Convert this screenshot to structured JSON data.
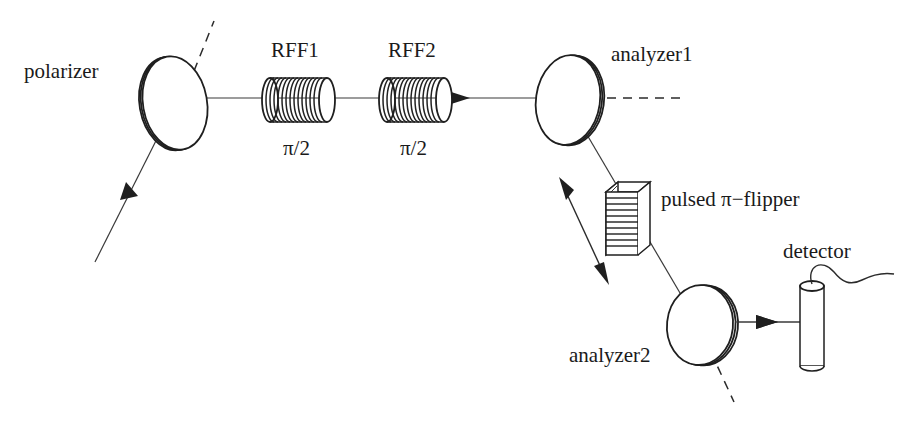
{
  "figure": {
    "background_color": "#ffffff",
    "line_color": "#2b2b2b",
    "width": 904,
    "height": 432
  },
  "labels": {
    "polarizer": "polarizer",
    "rff1": "RFF1",
    "rff1_angle": "π/2",
    "rff2": "RFF2",
    "rff2_angle": "π/2",
    "analyzer1": "analyzer1",
    "pulsed_flipper": "pulsed π−flipper",
    "analyzer2": "analyzer2",
    "detector": "detector"
  },
  "components": [
    {
      "name": "polarizer",
      "label": "polarizer",
      "kind": "tilted-disk",
      "center": [
        175,
        103
      ],
      "rx": 32,
      "ry": 47,
      "edge_side": "left"
    },
    {
      "name": "rff1",
      "label": "RFF1",
      "sublabel": "π/2",
      "kind": "solenoid-coil",
      "center": [
        298,
        100
      ],
      "length": 60,
      "radius": 23,
      "turns": 13
    },
    {
      "name": "rff2",
      "label": "RFF2",
      "sublabel": "π/2",
      "kind": "solenoid-coil",
      "center": [
        415,
        100
      ],
      "length": 60,
      "radius": 23,
      "turns": 13
    },
    {
      "name": "analyzer1",
      "label": "analyzer1",
      "kind": "tilted-disk",
      "center": [
        568,
        100
      ],
      "rx": 33,
      "ry": 45,
      "edge_side": "right"
    },
    {
      "name": "pulsed-flipper",
      "label": "pulsed π−flipper",
      "kind": "striped-box",
      "origin": [
        606,
        186
      ],
      "width": 32,
      "height": 68,
      "depth": 12,
      "stripes": 11
    },
    {
      "name": "analyzer2",
      "label": "analyzer2",
      "kind": "tilted-disk",
      "center": [
        700,
        325
      ],
      "rx": 34,
      "ry": 40,
      "edge_side": "right"
    },
    {
      "name": "detector",
      "label": "detector",
      "kind": "cylinder-with-cable",
      "center": [
        812,
        325
      ],
      "width": 24,
      "height": 86
    }
  ],
  "beam_path": {
    "description": "neutron beam from lower-left through polarizer, RFF1, RFF2, analyzer1, flipper, analyzer2, into detector",
    "segments": [
      {
        "from": [
          95,
          262
        ],
        "to": [
          175,
          103
        ],
        "arrow": "mid"
      },
      {
        "from": [
          175,
          98
        ],
        "to": [
          536,
          98
        ],
        "arrow": "end"
      },
      {
        "from": [
          568,
          100
        ],
        "to": [
          700,
          325
        ],
        "arrow": "none"
      },
      {
        "from": [
          735,
          322
        ],
        "to": [
          800,
          322
        ],
        "arrow": "end"
      }
    ]
  },
  "axis_markers": [
    {
      "name": "polarizer-axis",
      "style": "dashed",
      "from": [
        187,
        88
      ],
      "to": [
        213,
        22
      ]
    },
    {
      "name": "analyzer1-axis",
      "style": "dashed",
      "from": [
        605,
        98
      ],
      "to": [
        680,
        98
      ]
    },
    {
      "name": "analyzer2-axis",
      "style": "dashed",
      "from": [
        686,
        295
      ],
      "to": [
        733,
        400
      ]
    }
  ],
  "annotations": [
    {
      "name": "flipper-double-arrow",
      "kind": "double-headed-arrow",
      "from": [
        561,
        184
      ],
      "to": [
        607,
        277
      ]
    }
  ]
}
